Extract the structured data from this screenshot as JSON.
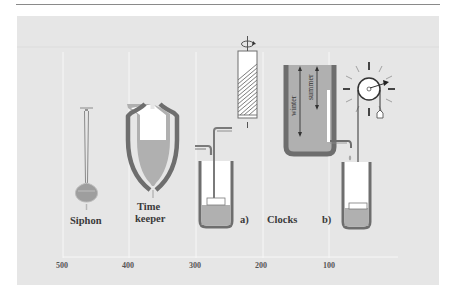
{
  "figure": {
    "labels": {
      "siphon": "Siphon",
      "timekeeper_line1": "Time",
      "timekeeper_line2": "keeper",
      "clocks": "Clocks",
      "a": "a)",
      "b": "b)",
      "winter": "winter",
      "summer": "summer"
    },
    "axis": {
      "ticks": [
        "500",
        "400",
        "300",
        "200",
        "100"
      ]
    },
    "colors": {
      "panel_bg": "#e6e6e6",
      "vessel_wall": "#6e6e6e",
      "water": "#b0b0b0",
      "gridline": "#f6f6f6"
    }
  }
}
